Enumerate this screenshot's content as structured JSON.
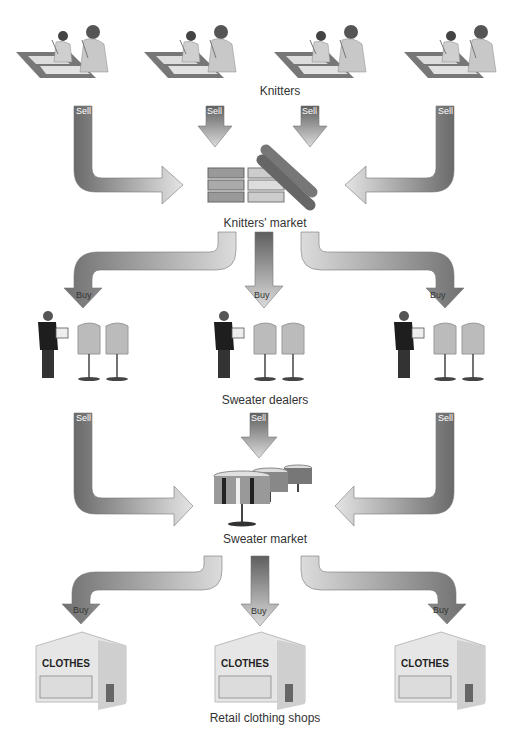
{
  "diagram": {
    "stages": [
      {
        "id": "knitters",
        "label": "Knitters"
      },
      {
        "id": "knitters_market",
        "label": "Knitters' market"
      },
      {
        "id": "sweater_dealers",
        "label": "Sweater dealers"
      },
      {
        "id": "sweater_market",
        "label": "Sweater market"
      },
      {
        "id": "retail_shops",
        "label": "Retail clothing shops"
      }
    ],
    "arrow_labels": {
      "sell": "Sell",
      "buy": "Buy"
    },
    "shop_sign": "CLOTHES",
    "colors": {
      "arrow_dark": "#6a6a6a",
      "arrow_light": "#e8e8e8",
      "text": "#333333"
    }
  }
}
